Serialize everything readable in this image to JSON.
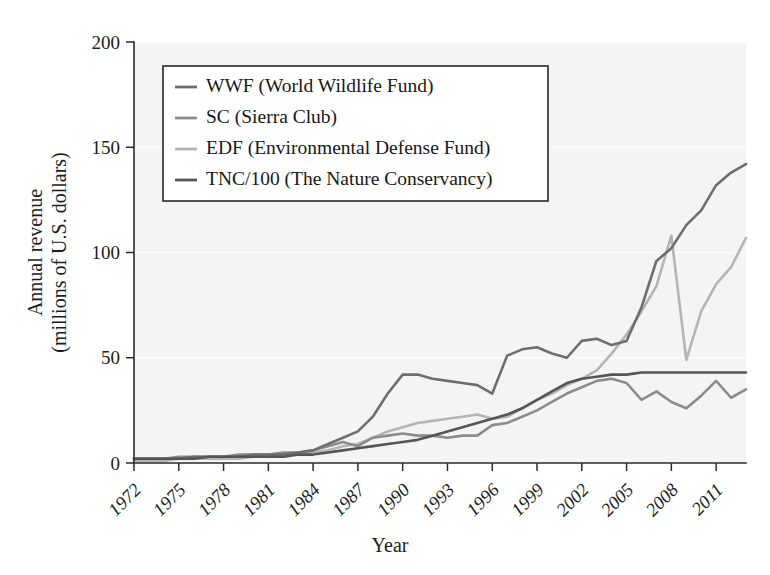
{
  "chart_data": {
    "type": "line",
    "title": "",
    "xlabel": "Year",
    "ylabel": "Annual revenue\n(millions of U.S. dollars)",
    "ylabel_line1": "Annual revenue",
    "ylabel_line2": "(millions of U.S. dollars)",
    "xlim": [
      1972,
      2013
    ],
    "ylim": [
      0,
      200
    ],
    "yticks": [
      0,
      50,
      100,
      150,
      200
    ],
    "xticks": [
      1972,
      1975,
      1978,
      1981,
      1984,
      1987,
      1990,
      1993,
      1996,
      1999,
      2002,
      2005,
      2008,
      2011
    ],
    "grid": "horizontal-white-on-gray",
    "legend_position": "upper-left-inside",
    "x": [
      1972,
      1973,
      1974,
      1975,
      1976,
      1977,
      1978,
      1979,
      1980,
      1981,
      1982,
      1983,
      1984,
      1985,
      1986,
      1987,
      1988,
      1989,
      1990,
      1991,
      1992,
      1993,
      1994,
      1995,
      1996,
      1997,
      1998,
      1999,
      2000,
      2001,
      2002,
      2003,
      2004,
      2005,
      2006,
      2007,
      2008,
      2009,
      2010,
      2011,
      2012,
      2013
    ],
    "series": [
      {
        "name": "WWF (World Wildlife Fund)",
        "label": "WWF (World Wildlife Fund)",
        "color": "#6e6e6e",
        "values": [
          2,
          2,
          2,
          2,
          3,
          3,
          3,
          3,
          4,
          4,
          4,
          5,
          6,
          9,
          12,
          15,
          22,
          33,
          42,
          42,
          40,
          39,
          38,
          37,
          33,
          51,
          54,
          55,
          52,
          50,
          58,
          59,
          56,
          58,
          74,
          96,
          102,
          113,
          120,
          132,
          138,
          142
        ]
      },
      {
        "name": "SC (Sierra Club)",
        "label": "SC (Sierra Club)",
        "color": "#8c8c8c",
        "values": [
          2,
          2,
          2,
          3,
          3,
          3,
          3,
          4,
          4,
          4,
          5,
          5,
          6,
          8,
          10,
          8,
          12,
          13,
          14,
          13,
          13,
          12,
          13,
          13,
          18,
          19,
          22,
          25,
          29,
          33,
          36,
          39,
          40,
          38,
          30,
          34,
          29,
          26,
          32,
          39,
          31,
          35
        ]
      },
      {
        "name": "EDF (Environmental Defense Fund)",
        "label": "EDF (Environmental Defense Fund)",
        "color": "#b4b4b4",
        "values": [
          1,
          1,
          1,
          2,
          2,
          2,
          2,
          2,
          3,
          3,
          3,
          4,
          5,
          6,
          8,
          9,
          12,
          15,
          17,
          19,
          20,
          21,
          22,
          23,
          21,
          22,
          26,
          30,
          33,
          37,
          40,
          44,
          52,
          61,
          72,
          84,
          108,
          49,
          72,
          85,
          93,
          107
        ]
      },
      {
        "name": "TNC/100 (The Nature Conservancy)",
        "label": "TNC/100 (The Nature Conservancy)",
        "color": "#555555",
        "values": [
          2,
          2,
          2,
          2,
          2,
          3,
          3,
          3,
          3,
          3,
          3,
          4,
          4,
          5,
          6,
          7,
          8,
          9,
          10,
          11,
          13,
          15,
          17,
          19,
          21,
          23,
          26,
          30,
          34,
          38,
          40,
          41,
          42,
          42,
          43,
          43,
          43,
          43,
          43,
          43,
          43,
          43
        ]
      }
    ]
  }
}
